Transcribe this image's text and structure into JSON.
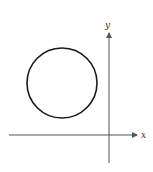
{
  "diagram": {
    "type": "coordinate-plane-circle",
    "axes": {
      "x_label": "x",
      "y_label": "y"
    },
    "circle": {
      "quadrant": "II",
      "stroke_color": "#1a1a1a"
    },
    "colors": {
      "axis": "#555555",
      "background": "#ffffff"
    }
  }
}
